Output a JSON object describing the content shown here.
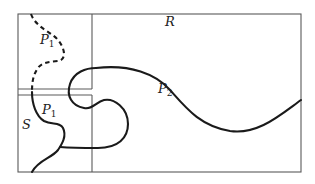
{
  "diagram": {
    "labels": {
      "region_R": "R",
      "region_S": "S",
      "path_P1_prime": "P",
      "path_P1_prime_sub": "1",
      "path_P1_prime_mark": "′",
      "path_P1": "P",
      "path_P1_sub": "1",
      "path_P2": "P",
      "path_P2_sub": "2"
    },
    "colors": {
      "frame": "#5a5a5a",
      "curve": "#1a1a1a",
      "background": "#ffffff"
    },
    "elements": [
      {
        "id": "R",
        "type": "rectangle",
        "description": "outer region"
      },
      {
        "id": "S",
        "type": "rectangle",
        "description": "lower-left subregion"
      },
      {
        "id": "P1'",
        "type": "dashed curve"
      },
      {
        "id": "P1",
        "type": "solid curve"
      },
      {
        "id": "P2",
        "type": "solid curve"
      }
    ]
  }
}
